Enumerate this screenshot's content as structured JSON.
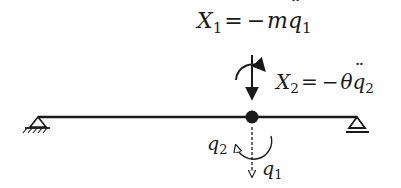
{
  "diagram": {
    "type": "structural-mechanics-beam",
    "colors": {
      "line": "#1a1a1a",
      "background": "#ffffff"
    },
    "beam": {
      "left_support": "pin-support",
      "right_support": "roller-support",
      "node": "center-mass-node"
    },
    "labels": {
      "x1": {
        "lhs": "X",
        "lhs_sub": "1",
        "op": "=",
        "rhs_sign": "−",
        "rhs_coef": "m",
        "rhs_var": "q",
        "rhs_sub": "1"
      },
      "x2": {
        "lhs": "X",
        "lhs_sub": "2",
        "op": "=",
        "rhs_sign": "−",
        "rhs_coef": "θ",
        "rhs_var": "q",
        "rhs_sub": "2"
      },
      "q1": {
        "var": "q",
        "sub": "1"
      },
      "q2": {
        "var": "q",
        "sub": "2"
      }
    },
    "arrows": {
      "inertial_force": "down-arrow (X1)",
      "inertial_moment": "clockwise arc arrow (X2)",
      "dof_translation": "dashed down-arrow (q1)",
      "dof_rotation": "counter-clockwise arc arrow (q2)"
    }
  }
}
